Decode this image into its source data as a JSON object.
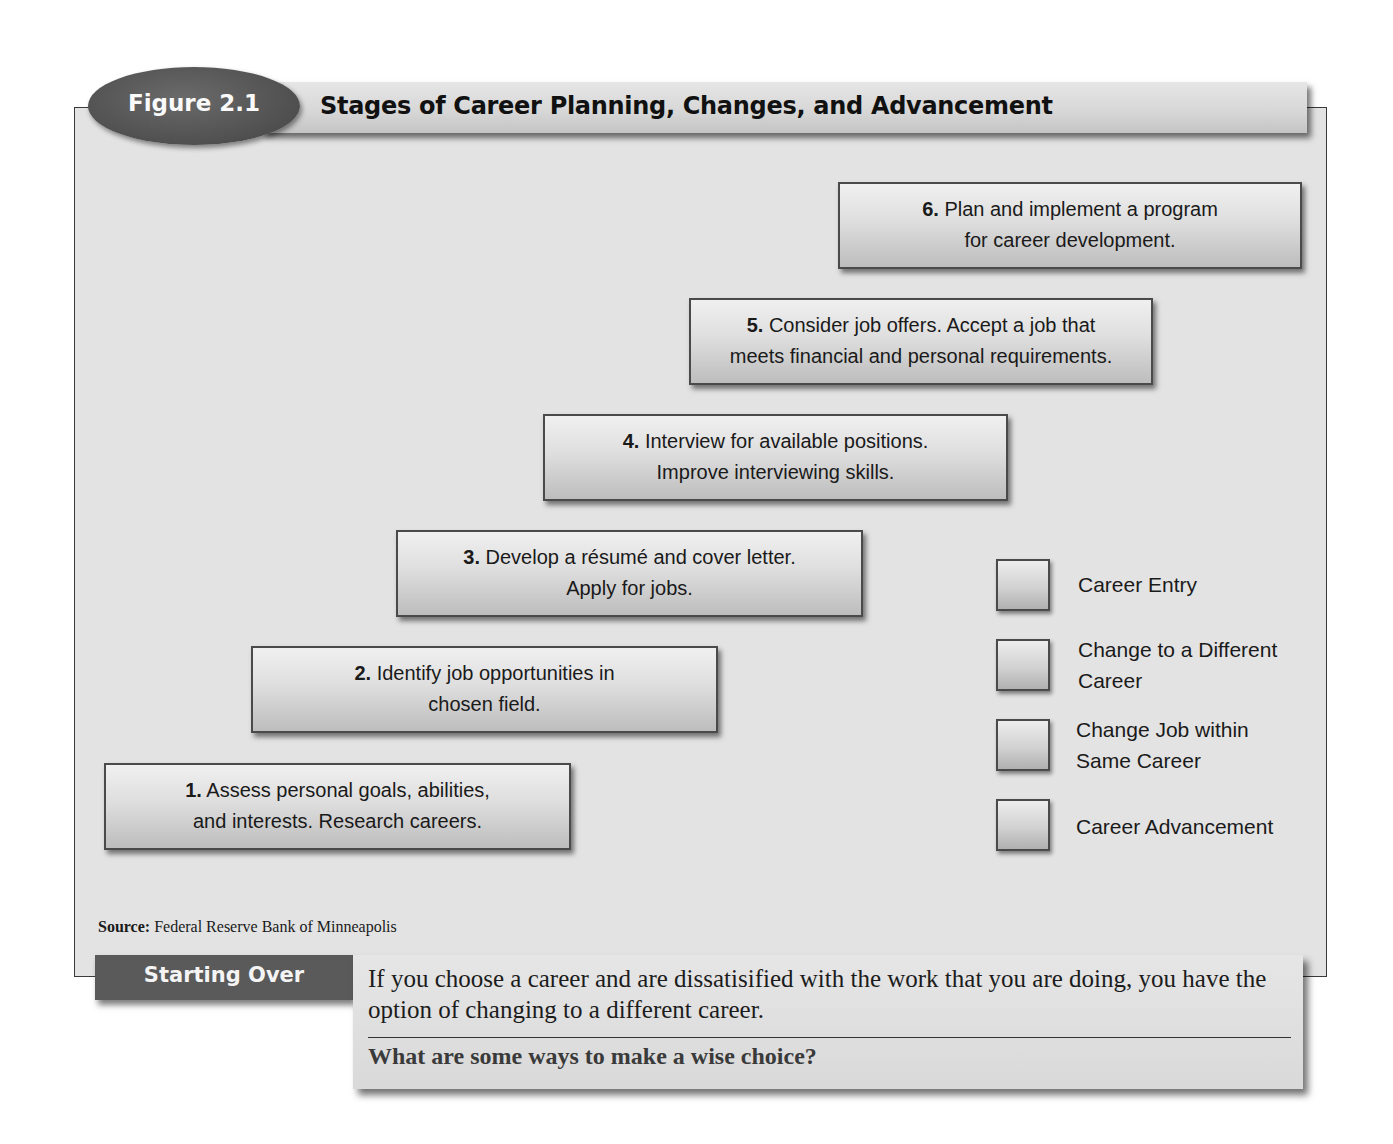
{
  "figure": {
    "label": "Figure 2.1",
    "title": "Stages of Career Planning, Changes, and Advancement"
  },
  "steps": [
    {
      "number": "1.",
      "line1": "Assess personal goals, abilities,",
      "line2": "and interests. Research careers."
    },
    {
      "number": "2.",
      "line1": "Identify job opportunities in",
      "line2": "chosen field."
    },
    {
      "number": "3.",
      "line1": "Develop a résumé and cover letter.",
      "line2": "Apply for jobs."
    },
    {
      "number": "4.",
      "line1": "Interview for available positions.",
      "line2": "Improve interviewing skills."
    },
    {
      "number": "5.",
      "line1": "Consider job offers. Accept a job that",
      "line2": "meets financial and personal requirements."
    },
    {
      "number": "6.",
      "line1": "Plan and implement a program",
      "line2": "for career development."
    }
  ],
  "legend": [
    {
      "line1": "Career Entry",
      "line2": ""
    },
    {
      "line1": "Change to a Different",
      "line2": "Career"
    },
    {
      "line1": "Change Job within",
      "line2": "Same Career"
    },
    {
      "line1": "Career Advancement",
      "line2": ""
    }
  ],
  "source": {
    "label": "Source:",
    "text": "Federal Reserve Bank of Minneapolis"
  },
  "caption": {
    "tab_label": "Starting Over",
    "body": "If you choose a career and are dissatisified with the work that you are doing, you have the option of changing to a different career.",
    "question": "What are some ways to make a wise choice?"
  },
  "colors": {
    "panel_background": "#e3e3e3",
    "oval_fill": "#555555",
    "tab_fill": "#5a5a5a",
    "border": "#3a3a3a"
  }
}
